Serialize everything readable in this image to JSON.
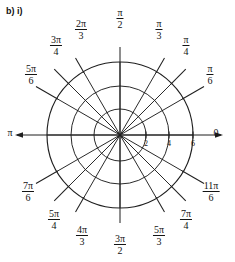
{
  "caption": "b) i)",
  "figure": {
    "type": "polar-grid",
    "center": {
      "x": 120,
      "y": 135
    },
    "circles": [
      {
        "r_value": 2,
        "r_px": 26
      },
      {
        "r_value": 4,
        "r_px": 49
      },
      {
        "r_value": 6,
        "r_px": 73
      }
    ],
    "radial_tick_labels": [
      {
        "text": "2",
        "r_value": 2
      },
      {
        "text": "4",
        "r_value": 4
      },
      {
        "text": "6",
        "r_value": 6
      }
    ],
    "axis_arrow_right_label": "0",
    "axis_arrow_left_label": "π",
    "grid": "on",
    "stroke_color": "#1f1f1f",
    "background": "#ffffff",
    "angles_deg": [
      0,
      30,
      45,
      60,
      90,
      120,
      135,
      150,
      180,
      210,
      225,
      240,
      270,
      300,
      315,
      330
    ],
    "angle_labels": [
      {
        "deg": 0,
        "kind": "plain",
        "text": "0"
      },
      {
        "deg": 30,
        "kind": "frac",
        "num": "π",
        "den": "6"
      },
      {
        "deg": 45,
        "kind": "frac",
        "num": "π",
        "den": "4"
      },
      {
        "deg": 60,
        "kind": "frac",
        "num": "π",
        "den": "3"
      },
      {
        "deg": 90,
        "kind": "frac",
        "num": "π",
        "den": "2"
      },
      {
        "deg": 120,
        "kind": "frac",
        "num": "2π",
        "den": "3"
      },
      {
        "deg": 135,
        "kind": "frac",
        "num": "3π",
        "den": "4"
      },
      {
        "deg": 150,
        "kind": "frac",
        "num": "5π",
        "den": "6"
      },
      {
        "deg": 180,
        "kind": "plain",
        "text": "π"
      },
      {
        "deg": 210,
        "kind": "frac",
        "num": "7π",
        "den": "6"
      },
      {
        "deg": 225,
        "kind": "frac",
        "num": "5π",
        "den": "4"
      },
      {
        "deg": 240,
        "kind": "frac",
        "num": "4π",
        "den": "3"
      },
      {
        "deg": 270,
        "kind": "frac",
        "num": "3π",
        "den": "2"
      },
      {
        "deg": 300,
        "kind": "frac",
        "num": "5π",
        "den": "3"
      },
      {
        "deg": 315,
        "kind": "frac",
        "num": "7π",
        "den": "4"
      },
      {
        "deg": 330,
        "kind": "frac",
        "num": "11π",
        "den": "6"
      }
    ]
  }
}
